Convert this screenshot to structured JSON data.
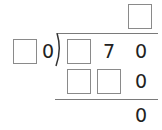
{
  "problem": {
    "type": "long-division",
    "quotient": {
      "boxes": 1
    },
    "divisor": {
      "box_count": 1,
      "digits": [
        "0"
      ]
    },
    "dividend": {
      "box_count": 1,
      "digits": [
        "7",
        "0"
      ]
    },
    "step1": {
      "box_count": 2,
      "digits": [
        "0"
      ]
    },
    "remainder": {
      "digits": [
        "0"
      ]
    }
  },
  "colors": {
    "box_border": "#8a8a8a",
    "line": "#7a7a7a",
    "text": "#222222"
  }
}
